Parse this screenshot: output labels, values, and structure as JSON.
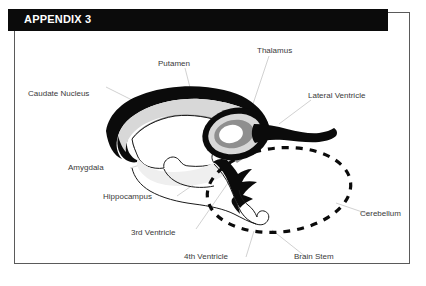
{
  "page": {
    "width": 426,
    "height": 286,
    "background": "#ffffff",
    "frame_color": "#5a5a5a"
  },
  "header": {
    "title": "APPENDIX 3",
    "background": "#0b0b0b",
    "text_color": "#ffffff"
  },
  "diagram": {
    "label_color": "#3a3a3a",
    "leader_color": "#b9b9b9",
    "colors": {
      "caudate_nucleus": "#0b0b0b",
      "putamen": "#9a9a9a",
      "inner_light_gray": "#d6d6d6",
      "ventricle_fill": "#efefef",
      "outline": "#1a1a1a",
      "cerebellum_dash": "#0b0b0b"
    },
    "labels": [
      {
        "id": "caudate-nucleus",
        "text": "Caudate Nucleus",
        "x": 14,
        "y": 78
      },
      {
        "id": "putamen",
        "text": "Putamen",
        "x": 144,
        "y": 48
      },
      {
        "id": "thalamus",
        "text": "Thalamus",
        "x": 243,
        "y": 35
      },
      {
        "id": "lateral-ventricle",
        "text": "Lateral Ventricle",
        "x": 294,
        "y": 80
      },
      {
        "id": "amygdala",
        "text": "Amygdala",
        "x": 68,
        "y": 156
      },
      {
        "id": "hippocampus",
        "text": "Hippocampus",
        "x": 103,
        "y": 185
      },
      {
        "id": "third-ventricle",
        "text": "3rd Ventricle",
        "x": 131,
        "y": 221
      },
      {
        "id": "fourth-ventricle",
        "text": "4th Ventricle",
        "x": 184,
        "y": 245
      },
      {
        "id": "brain-stem",
        "text": "Brain Stem",
        "x": 294,
        "y": 245
      },
      {
        "id": "cerebellum",
        "text": "Cerebellum",
        "x": 360,
        "y": 201
      }
    ]
  }
}
